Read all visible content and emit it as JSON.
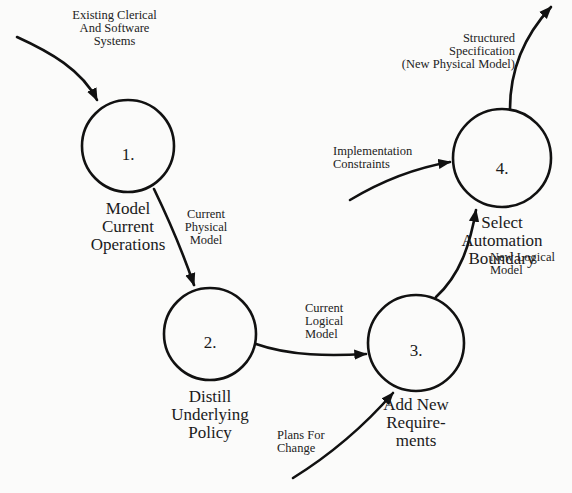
{
  "diagram": {
    "type": "data-flow-diagram",
    "processes": [
      {
        "id": "1",
        "number": "1.",
        "name": "Model\nCurrent\nOperations"
      },
      {
        "id": "2",
        "number": "2.",
        "name": "Distill\nUnderlying\nPolicy"
      },
      {
        "id": "3",
        "number": "3.",
        "name": "Add New\nRequire-\nments"
      },
      {
        "id": "4",
        "number": "4.",
        "name": "Select\nAutomation\nBoundary"
      }
    ],
    "flows": [
      {
        "id": "existing",
        "label": "Existing Clerical\nAnd Software\nSystems",
        "from": "external",
        "to": "1"
      },
      {
        "id": "physical",
        "label": "Current\nPhysical\nModel",
        "from": "1",
        "to": "2"
      },
      {
        "id": "logical",
        "label": "Current\nLogical\nModel",
        "from": "2",
        "to": "3"
      },
      {
        "id": "plans",
        "label": "Plans For\nChange",
        "from": "external",
        "to": "3"
      },
      {
        "id": "newlogical",
        "label": "New Logical\nModel",
        "from": "3",
        "to": "4"
      },
      {
        "id": "constraints",
        "label": "Implementation\nConstraints",
        "from": "external",
        "to": "4"
      },
      {
        "id": "spec",
        "label": "Structured\nSpecification\n(New Physical Model)",
        "from": "4",
        "to": "external"
      }
    ]
  }
}
